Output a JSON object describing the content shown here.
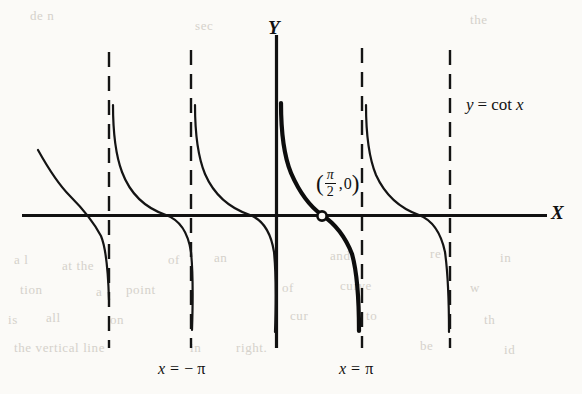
{
  "figure": {
    "axes": {
      "x_label": "X",
      "y_label": "Y"
    },
    "curve_label": {
      "lhs": "y",
      "equals": "=",
      "func": "cot",
      "arg": "x",
      "full": "y = cot x"
    },
    "point_label": {
      "open_paren": "(",
      "numerator": "π",
      "denominator": "2",
      "comma": ",",
      "y_value": "0",
      "close_paren": ")",
      "full": "(π/2, 0)"
    },
    "asymptote_labels": [
      {
        "name": "x-eq-neg-pi",
        "var": "x",
        "equals": "=",
        "value": "− π",
        "full": "x = −π"
      },
      {
        "name": "x-eq-pi",
        "var": "x",
        "equals": "=",
        "value": "π",
        "full": "x = π"
      }
    ],
    "colors": {
      "ink": "#111111",
      "paper": "#fbfaf7",
      "bleed": "#cfcbc4"
    },
    "bleed_text": [
      {
        "text": "de n",
        "x": 30,
        "y": 8
      },
      {
        "text": "sec",
        "x": 195,
        "y": 18
      },
      {
        "text": "the",
        "x": 470,
        "y": 12
      },
      {
        "text": "a l",
        "x": 14,
        "y": 252
      },
      {
        "text": "at the",
        "x": 62,
        "y": 258
      },
      {
        "text": "of",
        "x": 168,
        "y": 252
      },
      {
        "text": "an",
        "x": 214,
        "y": 250
      },
      {
        "text": "and",
        "x": 330,
        "y": 248
      },
      {
        "text": "re",
        "x": 430,
        "y": 246
      },
      {
        "text": "in",
        "x": 500,
        "y": 250
      },
      {
        "text": "tion",
        "x": 20,
        "y": 282
      },
      {
        "text": "a",
        "x": 96,
        "y": 284
      },
      {
        "text": "point",
        "x": 126,
        "y": 282
      },
      {
        "text": "of",
        "x": 282,
        "y": 280
      },
      {
        "text": "curve",
        "x": 340,
        "y": 278
      },
      {
        "text": "w",
        "x": 470,
        "y": 280
      },
      {
        "text": "is",
        "x": 8,
        "y": 312
      },
      {
        "text": "all",
        "x": 46,
        "y": 310
      },
      {
        "text": "on",
        "x": 110,
        "y": 312
      },
      {
        "text": "cur",
        "x": 290,
        "y": 308
      },
      {
        "text": "to",
        "x": 366,
        "y": 308
      },
      {
        "text": "th",
        "x": 484,
        "y": 312
      },
      {
        "text": "the vertical line",
        "x": 14,
        "y": 340
      },
      {
        "text": "in",
        "x": 190,
        "y": 340
      },
      {
        "text": "right.",
        "x": 236,
        "y": 340
      },
      {
        "text": "be",
        "x": 420,
        "y": 338
      },
      {
        "text": "id",
        "x": 504,
        "y": 342
      }
    ]
  },
  "chart_data": {
    "type": "line",
    "xlabel": "X",
    "ylabel": "Y",
    "function": "y = cot(x)",
    "grid": false,
    "legend": "none",
    "xlim_in_pi": [
      -2.5,
      2.0
    ],
    "ylim": [
      -3.6,
      3.6
    ],
    "origin_px": {
      "x": 276,
      "y": 215
    },
    "pi_in_px": 85.5,
    "y_unit_px": 36,
    "x_axis_px": {
      "y": 215,
      "x_start": 22,
      "x_end": 547
    },
    "y_axis_px": {
      "x": 276,
      "y_start": 35,
      "y_end": 348
    },
    "asymptotes": [
      {
        "label": "x = -3π",
        "x_over_pi": -2,
        "px": 109,
        "style": "dashed",
        "visible_label": null
      },
      {
        "label": "x = -2π",
        "x_over_pi": -1,
        "px": 191,
        "style": "dashed",
        "visible_label": null
      },
      {
        "label": "x = 0",
        "x_over_pi": 0,
        "px": 276,
        "style": "solid-axis",
        "visible_label": null
      },
      {
        "label": "x = π",
        "x_over_pi": 1,
        "px": 362,
        "style": "dashed",
        "visible_label": "x = π"
      },
      {
        "label": "x = 2π",
        "x_over_pi": 2,
        "px": 450,
        "style": "dashed",
        "visible_label": null
      }
    ],
    "asymptote_label_positions": [
      {
        "text": "x = − π",
        "px_x": 191,
        "px_y": 370
      },
      {
        "text": "x = π",
        "px_x": 362,
        "px_y": 370
      }
    ],
    "branches": [
      {
        "id": "branch-1",
        "between_px": [
          24,
          109
        ],
        "emphasis": "normal",
        "clipped_left": true
      },
      {
        "id": "branch-2",
        "between_px": [
          109,
          191
        ],
        "emphasis": "normal",
        "clipped_left": false
      },
      {
        "id": "branch-3",
        "between_px": [
          191,
          276
        ],
        "emphasis": "normal",
        "clipped_left": false
      },
      {
        "id": "branch-4",
        "between_px": [
          276,
          362
        ],
        "emphasis": "bold",
        "clipped_left": false
      },
      {
        "id": "branch-5",
        "between_px": [
          362,
          450
        ],
        "emphasis": "normal",
        "clipped_left": false
      }
    ],
    "marked_points": [
      {
        "label": "(π/2, 0)",
        "x_over_pi": 0.5,
        "y": 0,
        "px": {
          "x": 322,
          "y": 215
        },
        "marker": "open-circle"
      }
    ],
    "annotations": [
      {
        "text": "y = cot x",
        "px": {
          "x": 466,
          "y": 104
        }
      }
    ]
  }
}
